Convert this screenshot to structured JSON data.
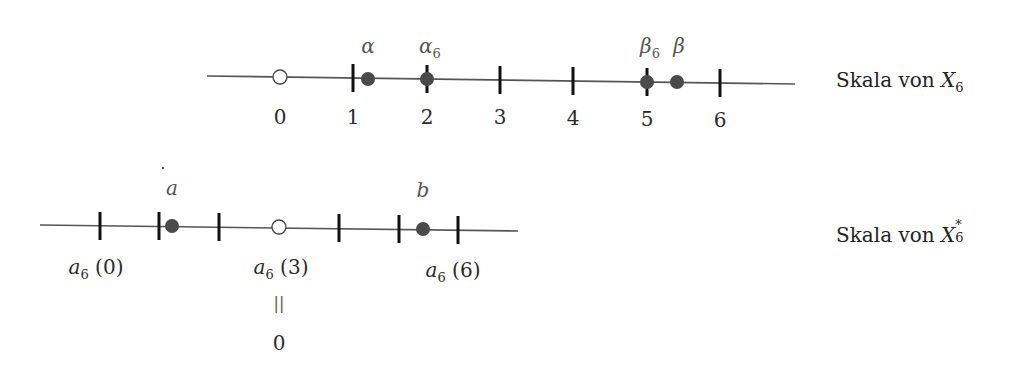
{
  "top_scale": {
    "title_prefix": "Skala von ",
    "title_var": "X",
    "title_sub": "6",
    "origin_label": "0",
    "ticks": [
      "1",
      "2",
      "3",
      "4",
      "5",
      "6"
    ],
    "points": {
      "alpha": "α",
      "alpha6_base": "α",
      "alpha6_sub": "6",
      "beta6_base": "β",
      "beta6_sub": "6",
      "beta": "β"
    }
  },
  "bottom_scale": {
    "title_prefix": "Skala von ",
    "title_var": "X",
    "title_sub": "6",
    "title_sup": "*",
    "points": {
      "a": "a",
      "b": "b"
    },
    "labels": {
      "a6_0_base": "a",
      "a6_0_sub": "6",
      "a6_0_arg": " (0)",
      "a6_3_base": "a",
      "a6_3_sub": "6",
      "a6_3_arg": " (3)",
      "a6_6_base": "a",
      "a6_6_sub": "6",
      "a6_6_arg": " (6)",
      "equals": "||",
      "zero": "0"
    }
  },
  "colors": {
    "line": "#555555",
    "tick": "#111111",
    "dot": "#4a4a4a",
    "greek_label": "#555555"
  }
}
